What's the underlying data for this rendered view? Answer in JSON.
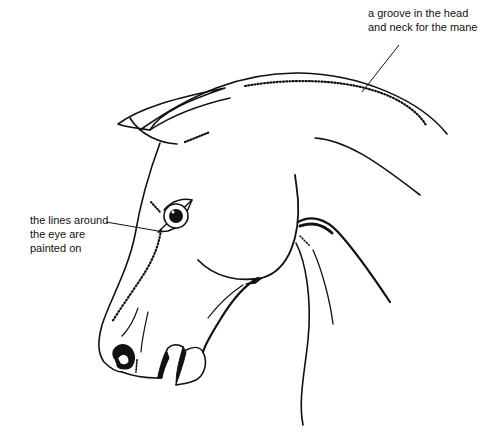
{
  "figure": {
    "colors": {
      "background": "#ffffff",
      "ink": "#111111"
    },
    "annotations": [
      {
        "id": "mane-groove",
        "lines": [
          "a groove in the head",
          "and neck for the mane"
        ],
        "points_to": "dotted groove along crest of head and neck"
      },
      {
        "id": "eye-lines",
        "lines": [
          "the lines around",
          "the eye are",
          "painted on"
        ],
        "points_to": "painted lines at corner of eye"
      }
    ]
  }
}
